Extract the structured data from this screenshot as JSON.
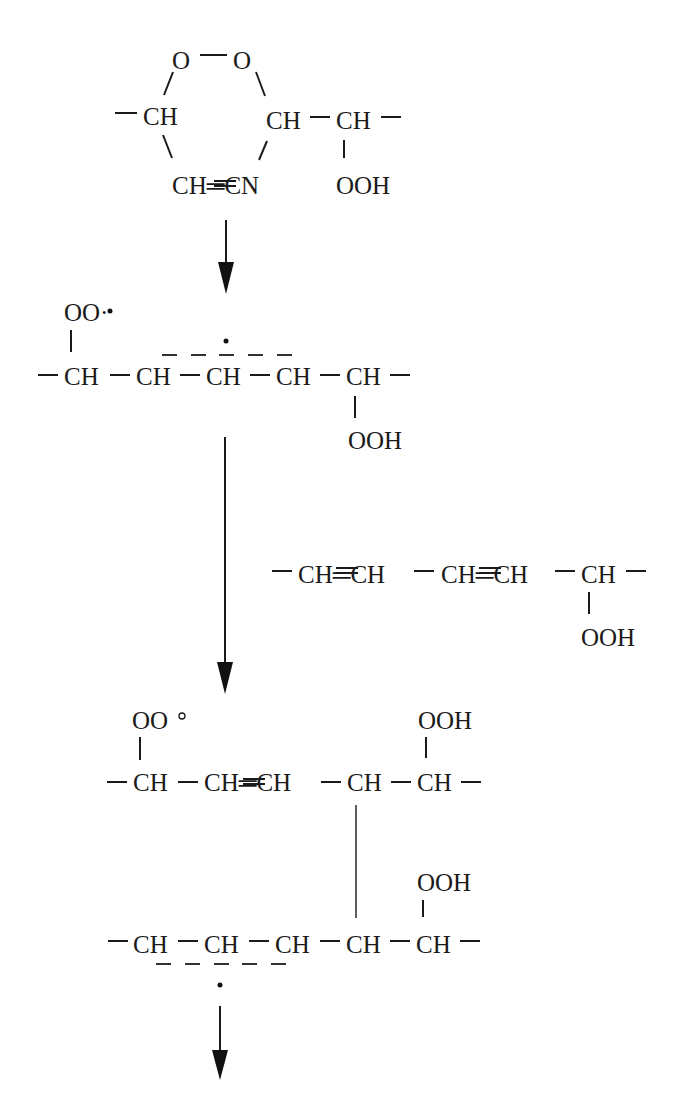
{
  "diagram": {
    "type": "reaction-scheme",
    "structures": {
      "ring": {
        "o_left": "O",
        "o_right": "O",
        "left_ch": "CH",
        "right_ch": "CH",
        "ch2": "CH",
        "bottom": "CH═CN",
        "ooh": "OOH"
      },
      "radical": {
        "peroxyl": "OO·",
        "chain": [
          "CH",
          "CH",
          "CH",
          "CH",
          "CH"
        ],
        "ooh": "OOH"
      },
      "diene": {
        "chain": "CH═CH – CH═CH – CH",
        "ooh": "OOH"
      },
      "dimer_top": {
        "peroxyl": "OO°",
        "ooh": "OOH",
        "chain": [
          "CH",
          "CH═CH",
          "CH",
          "CH"
        ]
      },
      "dimer_bottom": {
        "ooh": "OOH",
        "chain": [
          "CH",
          "CH",
          "CH",
          "CH",
          "CH"
        ]
      }
    },
    "labels": {
      "O": "O",
      "CH": "CH",
      "OOH": "OOH",
      "OO_dot": "OO·",
      "OO_open": "OO",
      "CH_eq_CN": "CH═CN",
      "CH_eq_CH": "CH═CH",
      "dash": "–"
    },
    "arrows": [
      {
        "from": "ring",
        "to": "radical"
      },
      {
        "from": "radical",
        "to": "dimer_top",
        "with": "diene"
      },
      {
        "from": "dimer_bottom",
        "to": "next"
      }
    ]
  }
}
